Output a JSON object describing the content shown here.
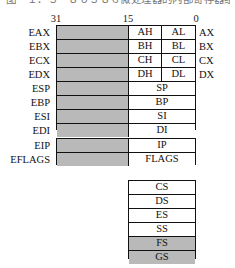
{
  "figure": {
    "caption_fragment": "图－１．３　８０３８６微处理器的内部寄存器组结构",
    "bit_ruler": {
      "high": "31",
      "mid": "15",
      "low": "0"
    },
    "colors": {
      "fill_gray": "#b9b9b9",
      "fill_white": "#ffffff",
      "border": "#111111",
      "text": "#111111",
      "background": "#ffffff"
    }
  },
  "general_purpose": {
    "rows": [
      {
        "ext_name": "EAX",
        "high_byte": "AH",
        "low_byte": "AL",
        "word_name": "AX",
        "upper_shaded": true
      },
      {
        "ext_name": "EBX",
        "high_byte": "BH",
        "low_byte": "BL",
        "word_name": "BX",
        "upper_shaded": true
      },
      {
        "ext_name": "ECX",
        "high_byte": "CH",
        "low_byte": "CL",
        "word_name": "CX",
        "upper_shaded": true
      },
      {
        "ext_name": "EDX",
        "high_byte": "DH",
        "low_byte": "DL",
        "word_name": "DX",
        "upper_shaded": true
      }
    ]
  },
  "index_pointer": {
    "rows": [
      {
        "ext_name": "ESP",
        "word_name": "SP",
        "upper_shaded": true
      },
      {
        "ext_name": "EBP",
        "word_name": "BP",
        "upper_shaded": true
      },
      {
        "ext_name": "ESI",
        "word_name": "SI",
        "upper_shaded": true
      },
      {
        "ext_name": "EDI",
        "word_name": "DI",
        "upper_shaded": true
      }
    ]
  },
  "instruction_flags": {
    "rows": [
      {
        "ext_name": "EIP",
        "word_name": "IP",
        "upper_shaded": true
      },
      {
        "ext_name": "EFLAGS",
        "word_name": "FLAGS",
        "upper_shaded": true
      }
    ]
  },
  "segment_registers": {
    "rows": [
      {
        "name": "CS",
        "shaded": false
      },
      {
        "name": "DS",
        "shaded": false
      },
      {
        "name": "ES",
        "shaded": false
      },
      {
        "name": "SS",
        "shaded": false
      },
      {
        "name": "FS",
        "shaded": true
      },
      {
        "name": "GS",
        "shaded": true
      }
    ]
  }
}
